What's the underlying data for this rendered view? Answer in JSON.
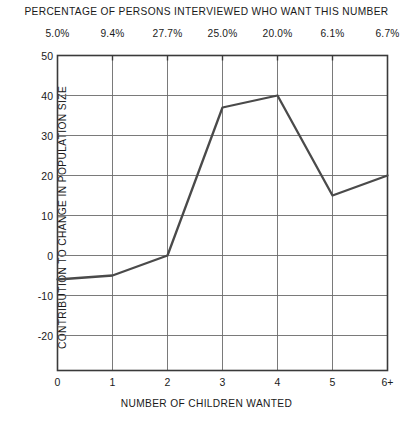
{
  "chart_data": {
    "type": "line",
    "title": "",
    "top_axis_label": "PERCENTAGE OF PERSONS INTERVIEWED WHO WANT THIS NUMBER",
    "xlabel": "NUMBER OF CHILDREN WANTED",
    "ylabel": "CONTRIBUTION TO CHANGE IN POPULATION SIZE",
    "categories": [
      "0",
      "1",
      "2",
      "3",
      "4",
      "5",
      "6+"
    ],
    "values": [
      -6,
      -5,
      0,
      37,
      40,
      15,
      20
    ],
    "top_tick_labels": [
      "5.0%",
      "9.4%",
      "27.7%",
      "25.0%",
      "20.0%",
      "6.1%",
      "6.7%"
    ],
    "ytick_labels": [
      "50",
      "40",
      "30",
      "20",
      "10",
      "0",
      "-10",
      "-20"
    ],
    "ytick_values": [
      50,
      40,
      30,
      20,
      10,
      0,
      -10,
      -20
    ],
    "ylim": [
      -28,
      50
    ],
    "xlim": [
      0,
      6
    ],
    "grid": true,
    "legend": null,
    "series": [
      {
        "name": "Contribution to change in population size",
        "values": [
          -6,
          -5,
          0,
          37,
          40,
          15,
          20
        ]
      }
    ],
    "line_color": "#4a4a4a",
    "grid_color": "#6b6b6b",
    "axis_color": "#3a3a3a"
  }
}
